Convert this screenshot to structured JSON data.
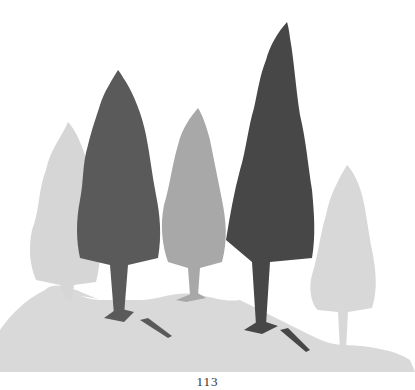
{
  "page": {
    "number": "113"
  },
  "illustration": {
    "subject": "conifer trees on hillside",
    "colors": {
      "dark_tree": "#4a4a4a",
      "mid_tree": "#5c5c5c",
      "light_tree": "#a9a9a9",
      "pale_tree": "#d6d6d6",
      "ground": "#d9d9d9",
      "background": "#ffffff"
    }
  }
}
